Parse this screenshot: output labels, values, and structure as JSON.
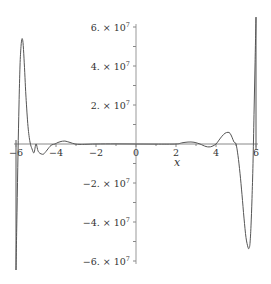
{
  "chart_data": {
    "type": "line",
    "title": "",
    "xlabel": "x",
    "ylabel": "",
    "xlim": [
      -6,
      6
    ],
    "ylim": [
      -66000000,
      66000000
    ],
    "grid": false,
    "legend": null,
    "x_ticks": [
      -6,
      -4,
      -2,
      0,
      2,
      4,
      6
    ],
    "x_tick_labels": [
      "-6",
      "-4",
      "-2",
      "0",
      "2",
      "4",
      "6"
    ],
    "y_ticks": [
      -60000000,
      -40000000,
      -20000000,
      20000000,
      40000000,
      60000000
    ],
    "y_tick_labels": [
      "-6. × 10",
      "-4. × 10",
      "-2. × 10",
      "2. × 10",
      "4. × 10",
      "6. × 10"
    ],
    "y_tick_exponent": "7",
    "vertical_lines": [
      -6,
      6
    ],
    "series": [
      {
        "name": "f(x)",
        "color": "#555555",
        "x": [
          -6.0,
          -5.95,
          -5.9,
          -5.85,
          -5.8,
          -5.75,
          -5.7,
          -5.65,
          -5.6,
          -5.55,
          -5.5,
          -5.4,
          -5.3,
          -5.2,
          -5.1,
          -5.0,
          -4.9,
          -4.8,
          -4.7,
          -4.65,
          -4.6,
          -4.5,
          -4.4,
          -4.3,
          -4.2,
          -4.05,
          -3.9,
          -3.75,
          -3.6,
          -3.5,
          -3.3,
          -3.05,
          -2.8,
          -2.5,
          -2.0,
          -1.0,
          0.0,
          1.0,
          2.0,
          2.3,
          2.6,
          2.9,
          3.2,
          3.35,
          3.5,
          3.65,
          3.8,
          4.0,
          4.15,
          4.3,
          4.45,
          4.6,
          4.7,
          4.8,
          4.9,
          5.0,
          5.1,
          5.2,
          5.3,
          5.4,
          5.5,
          5.6,
          5.65,
          5.7,
          5.75,
          5.8,
          5.85,
          5.9,
          5.95,
          6.0
        ],
        "y": [
          -65000000,
          -35000000,
          -5000000,
          20000000,
          40000000,
          50000000,
          54000000,
          52000000,
          44000000,
          34000000,
          24000000,
          9000000,
          1000000,
          -2500000,
          -4500000,
          0,
          -3500000,
          -4800000,
          -5200000,
          -5300000,
          -5000000,
          -3800000,
          -2500000,
          -1200000,
          -400000,
          0,
          800000,
          1300000,
          1500000,
          1400000,
          800000,
          0,
          -200000,
          -150000,
          0,
          50000,
          0,
          -50000,
          0,
          600000,
          1000000,
          900000,
          0,
          -700000,
          -1300000,
          -1500000,
          -1200000,
          0,
          2000000,
          4000000,
          5500000,
          6000000,
          5500000,
          3500000,
          1000000,
          0,
          -6000000,
          -15000000,
          -26000000,
          -38000000,
          -48000000,
          -53000000,
          -53500000,
          -51000000,
          -42000000,
          -28000000,
          -10000000,
          15000000,
          40000000,
          65000000
        ]
      }
    ]
  }
}
